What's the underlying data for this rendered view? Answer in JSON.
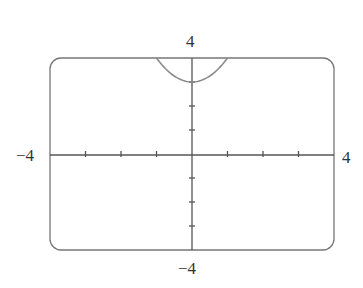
{
  "chart_data": {
    "type": "line",
    "title": "",
    "xlabel": "",
    "ylabel": "",
    "xlim": [
      -4,
      4
    ],
    "ylim": [
      -4,
      4
    ],
    "grid": false,
    "tick_labels": {
      "x_min": "−4",
      "x_max": "4",
      "y_min": "−4",
      "y_max": "4"
    },
    "x_ticks": [
      -3,
      -2,
      -1,
      1,
      2,
      3
    ],
    "y_ticks": [
      -3,
      -2,
      -1,
      1,
      2,
      3
    ],
    "series": [
      {
        "name": "y = x^2 + 3",
        "x": [
          -1,
          -0.75,
          -0.5,
          -0.25,
          0,
          0.25,
          0.5,
          0.75,
          1
        ],
        "y": [
          4,
          3.5625,
          3.25,
          3.0625,
          3,
          3.0625,
          3.25,
          3.5625,
          4
        ]
      }
    ],
    "colors": {
      "curve": "#8a8a8a",
      "axes": "#555555",
      "frame": "#777777"
    }
  }
}
